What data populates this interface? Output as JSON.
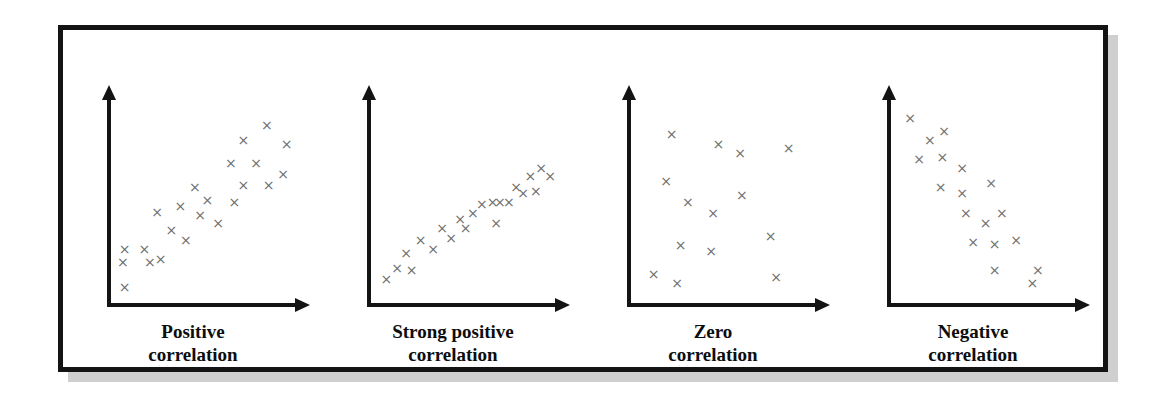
{
  "figure": {
    "border_color": "#141414",
    "shadow_color": "#cfcfcf",
    "background": "#ffffff",
    "marker_color": "#6e6e6e",
    "marker_glyph": "×"
  },
  "chart_data": [
    {
      "type": "scatter",
      "title": "Positive correlation",
      "caption_line1": "Positive",
      "caption_line2": "correlation",
      "xlabel": "",
      "ylabel": "",
      "xlim": [
        0,
        100
      ],
      "ylim": [
        0,
        100
      ],
      "grid": false,
      "legend": "none",
      "marker": "x",
      "points": [
        [
          2,
          2
        ],
        [
          1,
          15
        ],
        [
          16,
          15
        ],
        [
          2,
          22
        ],
        [
          13,
          22
        ],
        [
          22,
          17
        ],
        [
          28,
          32
        ],
        [
          20,
          42
        ],
        [
          36,
          27
        ],
        [
          44,
          40
        ],
        [
          33,
          45
        ],
        [
          48,
          48
        ],
        [
          41,
          55
        ],
        [
          54,
          36
        ],
        [
          63,
          47
        ],
        [
          68,
          56
        ],
        [
          61,
          68
        ],
        [
          82,
          56
        ],
        [
          75,
          68
        ],
        [
          90,
          62
        ],
        [
          68,
          80
        ],
        [
          92,
          78
        ],
        [
          81,
          88
        ]
      ]
    },
    {
      "type": "scatter",
      "title": "Strong positive correlation",
      "caption_line1": "Strong positive",
      "caption_line2": "correlation",
      "xlabel": "",
      "ylabel": "",
      "xlim": [
        0,
        100
      ],
      "ylim": [
        0,
        100
      ],
      "grid": false,
      "legend": "none",
      "marker": "x",
      "points": [
        [
          3,
          6
        ],
        [
          9,
          12
        ],
        [
          17,
          11
        ],
        [
          14,
          20
        ],
        [
          22,
          27
        ],
        [
          29,
          22
        ],
        [
          34,
          33
        ],
        [
          39,
          28
        ],
        [
          44,
          38
        ],
        [
          47,
          33
        ],
        [
          51,
          41
        ],
        [
          56,
          46
        ],
        [
          62,
          47
        ],
        [
          66,
          47
        ],
        [
          64,
          36
        ],
        [
          71,
          47
        ],
        [
          75,
          55
        ],
        [
          79,
          52
        ],
        [
          83,
          61
        ],
        [
          86,
          53
        ],
        [
          89,
          65
        ],
        [
          94,
          61
        ]
      ]
    },
    {
      "type": "scatter",
      "title": "Zero correlation",
      "caption_line1": "Zero",
      "caption_line2": "correlation",
      "xlabel": "",
      "ylabel": "",
      "xlim": [
        0,
        100
      ],
      "ylim": [
        0,
        100
      ],
      "grid": false,
      "legend": "none",
      "marker": "x",
      "points": [
        [
          7,
          9
        ],
        [
          20,
          4
        ],
        [
          22,
          24
        ],
        [
          26,
          47
        ],
        [
          14,
          58
        ],
        [
          17,
          83
        ],
        [
          39,
          21
        ],
        [
          40,
          41
        ],
        [
          43,
          78
        ],
        [
          56,
          51
        ],
        [
          55,
          73
        ],
        [
          72,
          29
        ],
        [
          75,
          7
        ],
        [
          82,
          76
        ]
      ]
    },
    {
      "type": "scatter",
      "title": "Negative correlation",
      "caption_line1": "Negative",
      "caption_line2": "correlation",
      "xlabel": "",
      "ylabel": "",
      "xlim": [
        0,
        100
      ],
      "ylim": [
        0,
        100
      ],
      "grid": false,
      "legend": "none",
      "marker": "x",
      "points": [
        [
          5,
          92
        ],
        [
          16,
          80
        ],
        [
          24,
          85
        ],
        [
          10,
          70
        ],
        [
          23,
          71
        ],
        [
          34,
          65
        ],
        [
          22,
          55
        ],
        [
          34,
          52
        ],
        [
          50,
          57
        ],
        [
          36,
          41
        ],
        [
          47,
          36
        ],
        [
          56,
          41
        ],
        [
          40,
          26
        ],
        [
          52,
          25
        ],
        [
          64,
          27
        ],
        [
          52,
          11
        ],
        [
          76,
          11
        ],
        [
          73,
          4
        ]
      ]
    }
  ]
}
